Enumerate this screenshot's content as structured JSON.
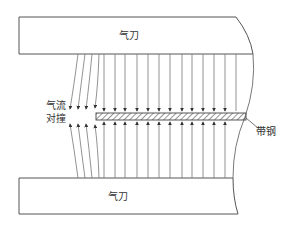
{
  "diagram": {
    "type": "air-knife-schematic",
    "labels": {
      "top_knife": "气刀",
      "bottom_knife": "气刀",
      "collision_line1": "气流",
      "collision_line2": "对撞",
      "strip": "带钢"
    },
    "colors": {
      "stroke": "#555555",
      "text": "#333333",
      "hatch": "#666666"
    },
    "straight_jet_x": [
      104,
      115,
      125,
      137,
      148,
      159,
      170,
      182,
      192,
      203,
      214,
      225,
      236
    ],
    "curved_jet_count": 4
  }
}
